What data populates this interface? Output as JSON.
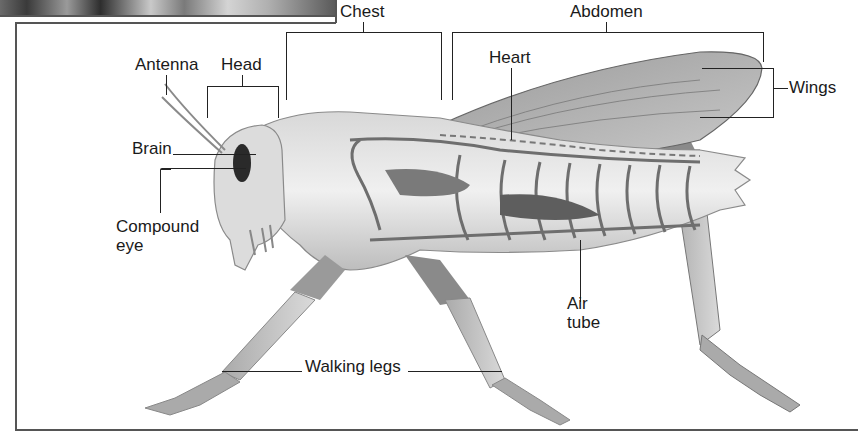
{
  "diagram": {
    "labels": {
      "antenna": "Antenna",
      "head": "Head",
      "chest": "Chest",
      "abdomen": "Abdomen",
      "heart": "Heart",
      "wings": "Wings",
      "brain": "Brain",
      "compound_eye_line1": "Compound",
      "compound_eye_line2": "eye",
      "air_tube_line1": "Air",
      "air_tube_line2": "tube",
      "walking_legs": "Walking legs"
    },
    "colors": {
      "line": "#222222",
      "frame": "#555555",
      "body_light": "#e4e4e4",
      "body_mid": "#b5b5b5",
      "body_dark": "#6e6e6e",
      "eye": "#2a2a2a"
    }
  }
}
